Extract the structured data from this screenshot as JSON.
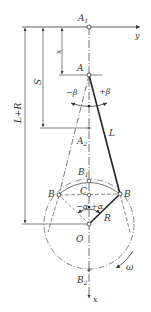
{
  "labels": {
    "A1": "A",
    "A1_sub": "1",
    "y_axis": "y",
    "x_dim": "x",
    "A": "A",
    "S": "S",
    "L_plus_R": "L+R",
    "minus_beta": "−β",
    "plus_beta": "+β",
    "L": "L",
    "A2": "A",
    "A2_sub": "2",
    "B1": "B",
    "B1_sub": "1",
    "C": "C",
    "B_left": "B",
    "B_right": "B",
    "minus_alpha": "−α",
    "plus_alpha": "+α",
    "R": "R",
    "O": "O",
    "omega": "ω",
    "B2": "B",
    "B2_sub": "2",
    "x_axis": "x"
  },
  "colors": {
    "line": "#333333",
    "thick": "#222222",
    "background": "#ffffff"
  }
}
